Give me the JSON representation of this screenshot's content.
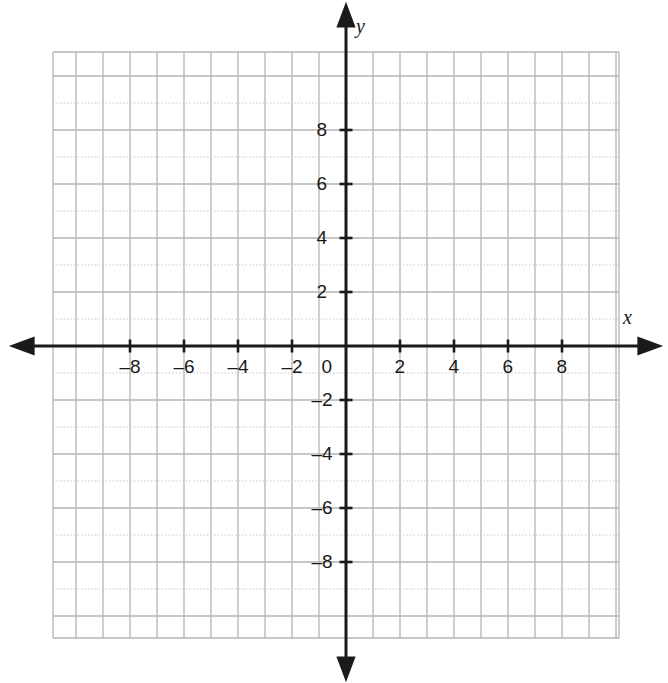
{
  "figure": {
    "kind": "coordinate-plane",
    "title": "",
    "axis_names": {
      "x": "x",
      "y": "y"
    },
    "origin_label": "0"
  },
  "chart_data": {
    "type": "scatter",
    "title": "",
    "subtitle": "",
    "xlabel": "x",
    "ylabel": "y",
    "xlim": [
      -10.85,
      10.11
    ],
    "ylim": [
      -10.81,
      10.89
    ],
    "xticks": [
      -8,
      -6,
      -4,
      -2,
      2,
      4,
      6,
      8
    ],
    "yticks": [
      -8,
      -6,
      -4,
      -2,
      2,
      4,
      6,
      8
    ],
    "xticklabels": [
      "–8",
      "–6",
      "–4",
      "–2",
      "2",
      "4",
      "6",
      "8"
    ],
    "yticklabels": [
      "–8",
      "–6",
      "–4",
      "–2",
      "2",
      "4",
      "6",
      "8"
    ],
    "origin_label": "0",
    "tick_step": 2,
    "minor_grid_step": 1,
    "grid": true,
    "grid_style": "alternating-solid-dotted-horizontal",
    "legend": null,
    "legend_position": "none",
    "series": [],
    "annotations": [],
    "axis_arrows": [
      "left",
      "right",
      "up",
      "down"
    ]
  },
  "style": {
    "axis_color": "#1a1a1a",
    "grid_color": "#b4b4b4",
    "grid_color_light": "#c9c9c9",
    "background": "#ffffff",
    "label_color": "#1a1a1a"
  },
  "geometry": {
    "origin_px": {
      "x": 346,
      "y": 346
    },
    "unit_px": 27,
    "grid_rect": {
      "left": 53,
      "top": 52,
      "right": 619,
      "bottom": 638
    }
  }
}
